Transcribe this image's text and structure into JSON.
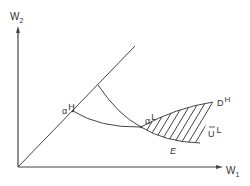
{
  "diagram": {
    "type": "economics-indifference-diagram",
    "axes": {
      "x": {
        "label": "W",
        "subscript": "1"
      },
      "y": {
        "label": "W",
        "subscript": "2"
      }
    },
    "points": [
      {
        "id": "alpha-H",
        "symbol": "α",
        "superscript": "H"
      },
      {
        "id": "alpha-L",
        "symbol": "α",
        "superscript": "L"
      }
    ],
    "curves": [
      {
        "id": "D-H",
        "label": "D",
        "superscript": "H"
      },
      {
        "id": "U-bar-L",
        "label": "U",
        "overbar": true,
        "superscript": "L"
      },
      {
        "id": "E",
        "label": "E"
      }
    ],
    "colors": {
      "line": "#444444",
      "text": "#333333",
      "background": "#ffffff"
    }
  }
}
